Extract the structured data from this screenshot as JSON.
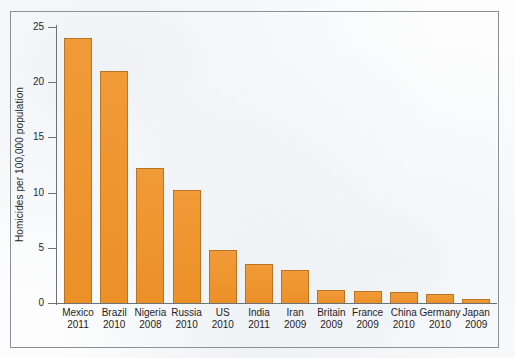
{
  "chart_data": {
    "type": "bar",
    "title": "",
    "subtitle": "",
    "xlabel": "",
    "ylabel": "Homicides per 100,000 population",
    "ylim": [
      0,
      25
    ],
    "yticks": [
      0,
      5,
      10,
      15,
      20,
      25
    ],
    "grid": false,
    "legend": false,
    "bar_color": "#EF9630",
    "bar_edge_color": "#B8752A",
    "categories": [
      "Mexico 2011",
      "Brazil 2010",
      "Nigeria 2008",
      "Russia 2010",
      "US 2010",
      "India 2011",
      "Iran 2009",
      "Britain 2009",
      "France 2009",
      "China 2010",
      "Germany 2010",
      "Japan 2009"
    ],
    "country_labels": [
      "Mexico",
      "Brazil",
      "Nigeria",
      "Russia",
      "US",
      "India",
      "Iran",
      "Britain",
      "France",
      "China",
      "Germany",
      "Japan"
    ],
    "year_labels": [
      "2011",
      "2010",
      "2008",
      "2010",
      "2010",
      "2011",
      "2009",
      "2009",
      "2009",
      "2010",
      "2010",
      "2009"
    ],
    "values": [
      24.0,
      21.0,
      12.2,
      10.2,
      4.8,
      3.5,
      3.0,
      1.2,
      1.1,
      1.0,
      0.8,
      0.4
    ]
  }
}
